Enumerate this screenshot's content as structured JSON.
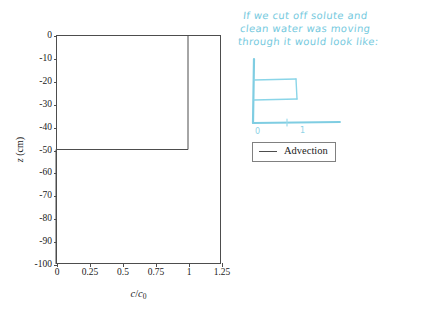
{
  "figure": {
    "background_color": "#ffffff",
    "axis_color": "#4d4d4d",
    "ink_color": "#6ec7dd"
  },
  "chart_data": {
    "type": "line",
    "title": "",
    "xlabel": "c/c_0",
    "ylabel": "z (cm)",
    "xlim": [
      0,
      1.25
    ],
    "ylim": [
      -100,
      0
    ],
    "grid": false,
    "legend_position": "center-right-outside",
    "xticks": [
      "0",
      "0.25",
      "0.5",
      "0.75",
      "1",
      "1.25"
    ],
    "xtick_values": [
      0,
      0.25,
      0.5,
      0.75,
      1,
      1.25
    ],
    "yticks": [
      "0",
      "-10",
      "-20",
      "-30",
      "-40",
      "-50",
      "-60",
      "-70",
      "-80",
      "-90",
      "-100"
    ],
    "ytick_values": [
      0,
      -10,
      -20,
      -30,
      -40,
      -50,
      -60,
      -70,
      -80,
      -90,
      -100
    ],
    "series": [
      {
        "name": "Advection",
        "color": "#4d4d4d",
        "description": "Sharp advective front: concentration c/c0 = 1 from z = 0 down to z = -50 cm, then c/c0 = 0 below -50 cm",
        "x": [
          1,
          1,
          0,
          0
        ],
        "y": [
          0,
          -50,
          -50,
          -100
        ]
      }
    ]
  },
  "legend": {
    "entries": [
      {
        "label": "Advection",
        "swatch": "line-swatch"
      }
    ]
  },
  "annotation": {
    "lines": [
      "If we cut off solute and",
      "clean water was moving",
      "through it would look like:"
    ],
    "sketch": {
      "name": "hand-drawn-breakthrough-sketch",
      "description": "Hand sketch of a rectangular pulse: axis with a box/plateau between 0 and 1",
      "axis_labels": [
        "0",
        "1"
      ]
    }
  }
}
